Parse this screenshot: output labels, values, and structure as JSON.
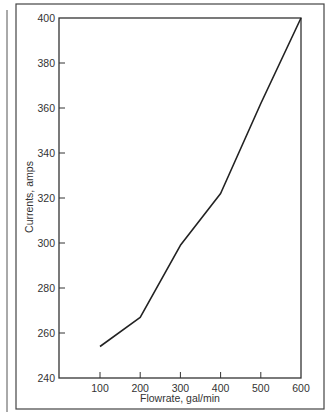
{
  "chart_data": {
    "type": "line",
    "title": "",
    "xlabel": "Flowrate, gal/min",
    "ylabel": "Currents, amps",
    "xlim": [
      50,
      600
    ],
    "ylim": [
      240,
      400
    ],
    "x_ticks": [
      100,
      200,
      300,
      400,
      500,
      600
    ],
    "y_ticks": [
      240,
      260,
      280,
      300,
      320,
      340,
      360,
      380,
      400
    ],
    "x_tick_labels": [
      "100",
      "200",
      "300",
      "400",
      "500",
      "600"
    ],
    "y_tick_labels": [
      "240",
      "260",
      "280",
      "300",
      "320",
      "340",
      "360",
      "380",
      "400"
    ],
    "grid": false,
    "legend": null,
    "series": [
      {
        "name": "Current vs Flowrate",
        "x": [
          100,
          200,
          300,
          400,
          500,
          600
        ],
        "values": [
          254,
          267,
          299,
          322,
          362,
          400
        ]
      }
    ]
  },
  "colors": {
    "line": "#222222",
    "axis": "#333333",
    "frame": "#444444",
    "background": "#ffffff"
  }
}
